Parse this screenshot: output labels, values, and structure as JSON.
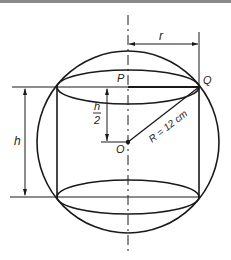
{
  "diagram": {
    "labels": {
      "r": "r",
      "P": "P",
      "Q": "Q",
      "O": "O",
      "h": "h",
      "h_half_num": "h",
      "h_half_den": "2",
      "R": "R = 12 cm"
    },
    "colors": {
      "stroke": "#1a1a1a",
      "background": "#ffffff"
    }
  }
}
